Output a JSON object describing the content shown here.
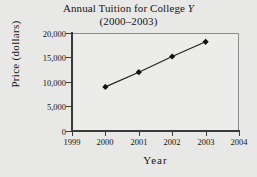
{
  "chart_data": {
    "type": "line",
    "title": "Annual Tuition for College Y",
    "title_main": "Annual Tuition for College ",
    "title_italic": "Y",
    "subtitle": "(2000–2003)",
    "xlabel": "Year",
    "ylabel": "Price (dollars)",
    "x": [
      2000,
      2001,
      2002,
      2003
    ],
    "values": [
      9000,
      12000,
      15200,
      18200
    ],
    "series": [
      {
        "name": "Annual Tuition",
        "values": [
          9000,
          12000,
          15200,
          18200
        ]
      }
    ],
    "xlim": [
      1999,
      2004
    ],
    "ylim": [
      0,
      20000
    ],
    "xticks": [
      1999,
      2000,
      2001,
      2002,
      2003,
      2004
    ],
    "xtick_labels": [
      "1999",
      "2000",
      "2001",
      "2002",
      "2003",
      "2004"
    ],
    "yticks": [
      0,
      5000,
      10000,
      15000,
      20000
    ],
    "ytick_labels": [
      "0",
      "5,000",
      "10,000",
      "15,000",
      "20,000"
    ],
    "grid": false,
    "legend": false,
    "marker": "diamond",
    "marker_color": "#111111",
    "line_color": "#222222",
    "plot_background": "#ececeb",
    "figure_background": "#e8e8e6"
  }
}
